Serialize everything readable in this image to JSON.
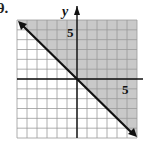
{
  "problem": {
    "number": "9."
  },
  "chart_data": {
    "type": "line",
    "title": "",
    "subtitle": "",
    "xlabel": "",
    "ylabel": "y",
    "xlim": [
      -6,
      6
    ],
    "ylim": [
      -6,
      6
    ],
    "grid": true,
    "legend": "none",
    "tick_labels": {
      "x": [
        "5"
      ],
      "y": [
        "5"
      ]
    },
    "series": [
      {
        "name": "boundary y = -x",
        "style": "solid",
        "arrows": "both",
        "x": [
          -6,
          6
        ],
        "y": [
          6,
          -6
        ]
      }
    ],
    "shaded_region": {
      "description": "region above line y = -x",
      "inequality": "y >= -x"
    },
    "colors": {
      "shade": "#c8c8c8",
      "grid": "#9a9a9a",
      "line": "#111111"
    }
  }
}
